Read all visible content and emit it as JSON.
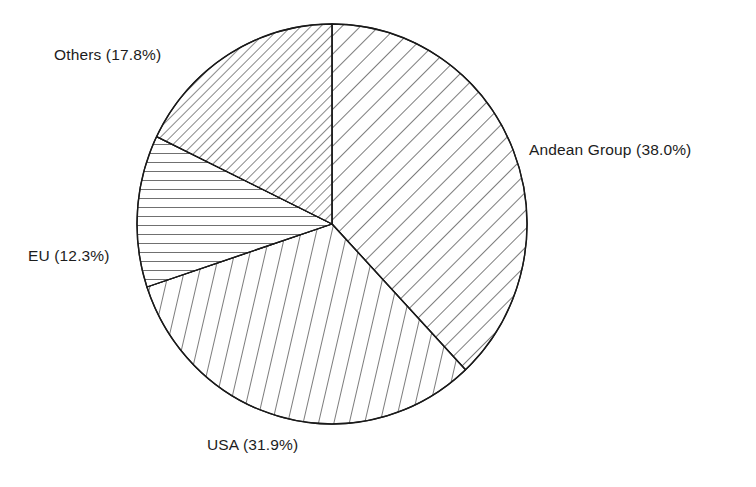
{
  "chart_data": {
    "type": "pie",
    "title": "",
    "subtitle": "",
    "xlabel": "",
    "ylabel": "",
    "legend_position": "none",
    "grid": false,
    "label_format": "{name} ({value}%)",
    "start_angle_deg": 0,
    "direction": "clockwise",
    "categories": [
      "Andean Group",
      "USA",
      "EU",
      "Others"
    ],
    "values": [
      38.0,
      31.9,
      12.3,
      17.8
    ],
    "total": 100.0,
    "slices": [
      {
        "name": "Andean Group",
        "value": 38.0,
        "label": "Andean Group (38.0%)",
        "angle_deg": 136.8,
        "start_deg": 0.0,
        "end_deg": 136.8,
        "fill": "hatch-diagonal-medium",
        "hatch_angle_deg": 45,
        "hatch_spacing_px": 13,
        "stroke": "#1a1a1a",
        "label_position": "right"
      },
      {
        "name": "USA",
        "value": 31.9,
        "label": "USA (31.9%)",
        "angle_deg": 114.84,
        "start_deg": 136.8,
        "end_deg": 251.64,
        "fill": "hatch-steep-vertical",
        "hatch_angle_deg": 77,
        "hatch_spacing_px": 15,
        "stroke": "#1a1a1a",
        "label_position": "bottom"
      },
      {
        "name": "EU",
        "value": 12.3,
        "label": "EU (12.3%)",
        "angle_deg": 44.28,
        "start_deg": 251.64,
        "end_deg": 295.92,
        "fill": "hatch-horizontal",
        "hatch_angle_deg": 0,
        "hatch_spacing_px": 9,
        "stroke": "#1a1a1a",
        "label_position": "left"
      },
      {
        "name": "Others",
        "value": 17.8,
        "label": "Others (17.8%)",
        "angle_deg": 64.08,
        "start_deg": 295.92,
        "end_deg": 360.0,
        "fill": "hatch-diagonal-dense",
        "hatch_angle_deg": 45,
        "hatch_spacing_px": 7,
        "stroke": "#1a1a1a",
        "label_position": "upper-left"
      }
    ],
    "geometry": {
      "center_x": 332,
      "center_y": 224,
      "radius_x": 195,
      "radius_y": 200
    },
    "colors": {
      "background": "#ffffff",
      "line": "#1a1a1a",
      "text": "#1c1c1c"
    }
  },
  "labels": {
    "andean": "Andean Group (38.0%)",
    "usa": "USA (31.9%)",
    "eu": "EU (12.3%)",
    "others": "Others (17.8%)"
  }
}
